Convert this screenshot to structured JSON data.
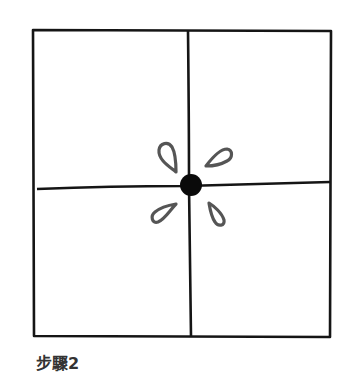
{
  "diagram": {
    "title": "步驟2",
    "elements": {
      "frame": "square-outline",
      "vertical_line": "center-vertical-divider",
      "horizontal_line": "center-horizontal-divider",
      "center_dot": "filled-black-circle",
      "petals": [
        "top-left-teardrop",
        "top-right-teardrop",
        "bottom-left-teardrop",
        "bottom-right-teardrop"
      ]
    },
    "colors": {
      "line": "#111111",
      "petal": "#555555",
      "dot": "#0a0a0a"
    }
  }
}
